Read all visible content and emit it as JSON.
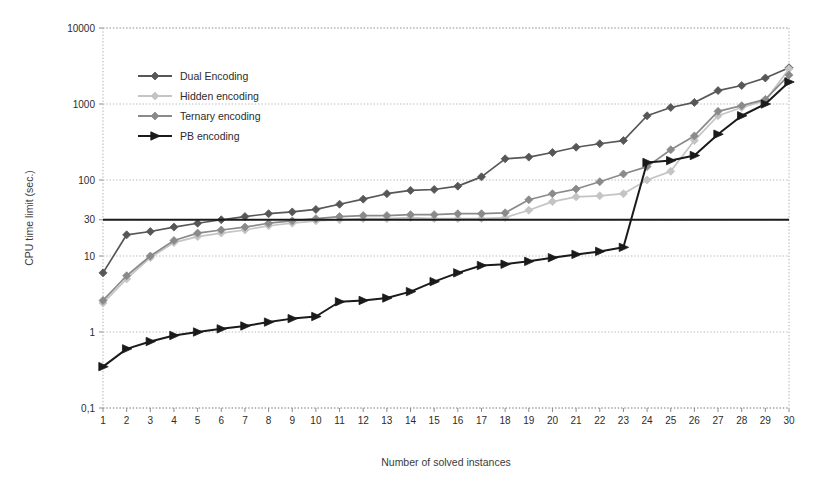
{
  "chart_data": {
    "type": "line",
    "title": "",
    "xlabel": "Number of solved instances",
    "ylabel": "CPU time limit (sec.)",
    "yscale": "log",
    "ylim": [
      0.1,
      10000
    ],
    "ytick_labels": [
      "10000",
      "1000",
      "100",
      "30",
      "10",
      "1",
      "0,1"
    ],
    "ytick_values": [
      10000,
      1000,
      100,
      30,
      10,
      1,
      0.1
    ],
    "xlim": [
      1,
      30
    ],
    "grid": true,
    "legend_position": "upper-left-inside",
    "reference_line": {
      "value": 30,
      "style": "solid",
      "color": "#1a1a1a",
      "label": ""
    },
    "x": [
      1,
      2,
      3,
      4,
      5,
      6,
      7,
      8,
      9,
      10,
      11,
      12,
      13,
      14,
      15,
      16,
      17,
      18,
      19,
      20,
      21,
      22,
      23,
      24,
      25,
      26,
      27,
      28,
      29,
      30
    ],
    "series": [
      {
        "name": "Dual Encoding",
        "color": "#575757",
        "marker": "diamond",
        "values": [
          6.0,
          19.0,
          21.0,
          24.0,
          27.0,
          30.0,
          33.0,
          36.0,
          38.0,
          41.0,
          48.0,
          56.0,
          66.0,
          73.0,
          75.0,
          83.0,
          110.0,
          190.0,
          200.0,
          230.0,
          270.0,
          300.0,
          330.0,
          700.0,
          900.0,
          1050.0,
          1500.0,
          1750.0,
          2200.0,
          3000.0
        ]
      },
      {
        "name": "Hidden encoding",
        "color": "#c4c4c4",
        "marker": "diamond",
        "values": [
          2.4,
          5.0,
          9.5,
          15.0,
          18.0,
          20.0,
          22.0,
          25.0,
          27.0,
          29.0,
          30.0,
          31.0,
          31.0,
          32.0,
          31.0,
          31.0,
          31.0,
          32.0,
          40.0,
          52.0,
          60.0,
          62.0,
          66.0,
          100.0,
          130.0,
          330.0,
          700.0,
          900.0,
          1100.0,
          2900.0
        ]
      },
      {
        "name": "Ternary encoding",
        "color": "#8a8a8a",
        "marker": "diamond",
        "values": [
          2.6,
          5.5,
          10.0,
          16.0,
          20.0,
          22.0,
          24.0,
          27.0,
          29.0,
          31.0,
          33.0,
          34.0,
          34.0,
          35.0,
          35.0,
          36.0,
          36.0,
          37.0,
          55.0,
          66.0,
          76.0,
          95.0,
          120.0,
          150.0,
          250.0,
          380.0,
          800.0,
          950.0,
          1150.0,
          2400.0
        ]
      },
      {
        "name": "PB encoding",
        "color": "#1a1a1a",
        "marker": "triangle",
        "values": [
          0.35,
          0.6,
          0.75,
          0.9,
          1.0,
          1.1,
          1.2,
          1.35,
          1.5,
          1.6,
          2.5,
          2.6,
          2.8,
          3.4,
          4.6,
          6.0,
          7.5,
          7.8,
          8.5,
          9.5,
          10.5,
          11.5,
          13.0,
          170.0,
          180.0,
          210.0,
          400.0,
          700.0,
          1000.0,
          1950.0
        ]
      }
    ]
  },
  "legend": {
    "entries": [
      {
        "label": "Dual Encoding"
      },
      {
        "label": "Hidden encoding"
      },
      {
        "label": "Ternary encoding"
      },
      {
        "label": "PB encoding"
      }
    ]
  }
}
